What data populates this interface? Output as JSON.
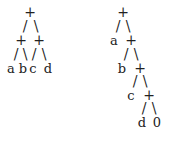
{
  "trees": [
    {
      "name": "balanced-tree",
      "expression": "(a+b)+(c+d)",
      "glyphs": [
        {
          "t": "+",
          "x": 30,
          "y": 12
        },
        {
          "t": "/",
          "x": 25,
          "y": 26
        },
        {
          "t": "\\",
          "x": 36,
          "y": 26
        },
        {
          "t": "+",
          "x": 21,
          "y": 40
        },
        {
          "t": "+",
          "x": 39,
          "y": 40
        },
        {
          "t": "/",
          "x": 16,
          "y": 54
        },
        {
          "t": "\\",
          "x": 25,
          "y": 54
        },
        {
          "t": "/",
          "x": 34,
          "y": 54
        },
        {
          "t": "\\",
          "x": 44,
          "y": 54
        },
        {
          "t": "a",
          "x": 11,
          "y": 68
        },
        {
          "t": "b",
          "x": 23,
          "y": 68
        },
        {
          "t": "c",
          "x": 33,
          "y": 68
        },
        {
          "t": "d",
          "x": 48,
          "y": 68
        }
      ]
    },
    {
      "name": "right-leaning-tree",
      "expression": "a+(b+(c+(d+0)))",
      "glyphs": [
        {
          "t": "+",
          "x": 123,
          "y": 12
        },
        {
          "t": "/",
          "x": 118,
          "y": 26
        },
        {
          "t": "\\",
          "x": 128,
          "y": 26
        },
        {
          "t": "a",
          "x": 114,
          "y": 40
        },
        {
          "t": "+",
          "x": 131,
          "y": 40
        },
        {
          "t": "/",
          "x": 126,
          "y": 54
        },
        {
          "t": "\\",
          "x": 136,
          "y": 54
        },
        {
          "t": "b",
          "x": 122,
          "y": 68
        },
        {
          "t": "+",
          "x": 140,
          "y": 68
        },
        {
          "t": "/",
          "x": 135,
          "y": 81
        },
        {
          "t": "\\",
          "x": 145,
          "y": 81
        },
        {
          "t": "c",
          "x": 131,
          "y": 95
        },
        {
          "t": "+",
          "x": 149,
          "y": 95
        },
        {
          "t": "/",
          "x": 144,
          "y": 108
        },
        {
          "t": "\\",
          "x": 154,
          "y": 108
        },
        {
          "t": "d",
          "x": 142,
          "y": 122
        },
        {
          "t": "0",
          "x": 157,
          "y": 122
        }
      ]
    }
  ]
}
